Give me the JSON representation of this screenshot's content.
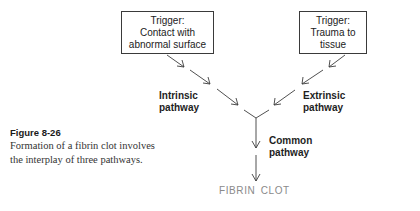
{
  "diagram": {
    "title": "Formation of a fibrin clot",
    "triggers": {
      "left": {
        "lines": [
          "Trigger:",
          "Contact with",
          "abnormal surface"
        ]
      },
      "right": {
        "lines": [
          "Trigger:",
          "Trauma to",
          "tissue"
        ]
      }
    },
    "pathways": {
      "intrinsic": {
        "lines": [
          "Intrinsic",
          "pathway"
        ]
      },
      "extrinsic": {
        "lines": [
          "Extrinsic",
          "pathway"
        ]
      },
      "common": {
        "lines": [
          "Common",
          "pathway"
        ]
      }
    },
    "outcome": {
      "label": "FIBRIN CLOT",
      "color": "#8a8a8a"
    },
    "edges": [
      {
        "from": "Trigger: Contact with abnormal surface",
        "to": "Intrinsic pathway"
      },
      {
        "from": "Trigger: Trauma to tissue",
        "to": "Extrinsic pathway"
      },
      {
        "from": "Intrinsic pathway",
        "to": "Common pathway"
      },
      {
        "from": "Extrinsic pathway",
        "to": "Common pathway"
      },
      {
        "from": "Common pathway",
        "to": "FIBRIN CLOT"
      }
    ]
  },
  "caption": {
    "figure_label": "Figure 8-26",
    "lines": [
      "Formation of a fibrin clot involves",
      "the interplay of three pathways."
    ]
  }
}
